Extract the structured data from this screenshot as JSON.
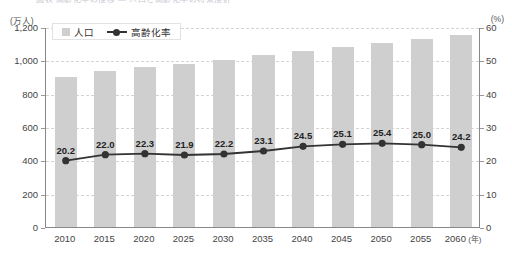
{
  "top_caption": "図表 高齢化率の推移 — 人口と高齢化率の将来推計",
  "axis": {
    "left_unit": "(万人)",
    "right_unit": "(%)",
    "x_unit": "(年)"
  },
  "legend": {
    "items": [
      {
        "label": "人口",
        "marker": "bar-swatch",
        "color": "#cfcfcf"
      },
      {
        "label": "高齢化率",
        "marker": "line-swatch",
        "color": "#333333"
      }
    ]
  },
  "chart_data": {
    "type": "bar",
    "title": "",
    "xlabel": "(年)",
    "ylabel": "(万人)",
    "ylabel_secondary": "(%)",
    "grid": true,
    "legend_position": "top-left",
    "categories": [
      "2010",
      "2015",
      "2020",
      "2025",
      "2030",
      "2035",
      "2040",
      "2045",
      "2050",
      "2055",
      "2060"
    ],
    "ylim": [
      0,
      1200
    ],
    "yticks": [
      "0",
      "200",
      "400",
      "600",
      "800",
      "1,000",
      "1,200"
    ],
    "ylim_secondary": [
      0,
      60
    ],
    "yticks_secondary": [
      "0",
      "10",
      "20",
      "30",
      "40",
      "50",
      "60"
    ],
    "series": [
      {
        "name": "人口",
        "type": "bar",
        "axis": "left",
        "unit": "万人",
        "color": "#cfcfcf",
        "values": [
          900,
          935,
          960,
          980,
          1005,
          1030,
          1055,
          1080,
          1105,
          1130,
          1150
        ]
      },
      {
        "name": "高齢化率",
        "type": "line",
        "axis": "right",
        "unit": "%",
        "color": "#333333",
        "values": [
          20.2,
          22.0,
          22.3,
          21.9,
          22.2,
          23.1,
          24.5,
          25.1,
          25.4,
          25.0,
          24.2
        ],
        "labels": [
          "20.2",
          "22.0",
          "22.3",
          "21.9",
          "22.2",
          "23.1",
          "24.5",
          "25.1",
          "25.4",
          "25.0",
          "24.2"
        ]
      }
    ]
  }
}
